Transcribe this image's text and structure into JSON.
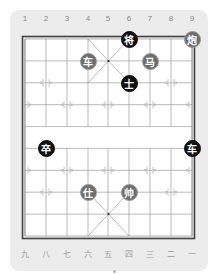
{
  "board": {
    "top_labels": [
      "1",
      "2",
      "3",
      "4",
      "5",
      "6",
      "7",
      "8",
      "9"
    ],
    "bottom_labels": [
      "九",
      "八",
      "七",
      "六",
      "五",
      "四",
      "三",
      "二",
      "一"
    ],
    "colors": {
      "panel": "#ececec",
      "red_piece": "#6d6d6d",
      "black_piece": "#111111",
      "line": "#555555"
    },
    "pieces": [
      {
        "char": "将",
        "side": "black",
        "col": 6,
        "row": 0
      },
      {
        "char": "炮",
        "side": "red",
        "col": 9,
        "row": 0
      },
      {
        "char": "车",
        "side": "red",
        "col": 4,
        "row": 1
      },
      {
        "char": "马",
        "side": "red",
        "col": 7,
        "row": 1
      },
      {
        "char": "士",
        "side": "black",
        "col": 6,
        "row": 2
      },
      {
        "char": "卒",
        "side": "black",
        "col": 2,
        "row": 5
      },
      {
        "char": "车",
        "side": "black",
        "col": 9,
        "row": 5
      },
      {
        "char": "仕",
        "side": "red",
        "col": 4,
        "row": 7
      },
      {
        "char": "帅",
        "side": "red",
        "col": 6,
        "row": 7
      }
    ]
  }
}
